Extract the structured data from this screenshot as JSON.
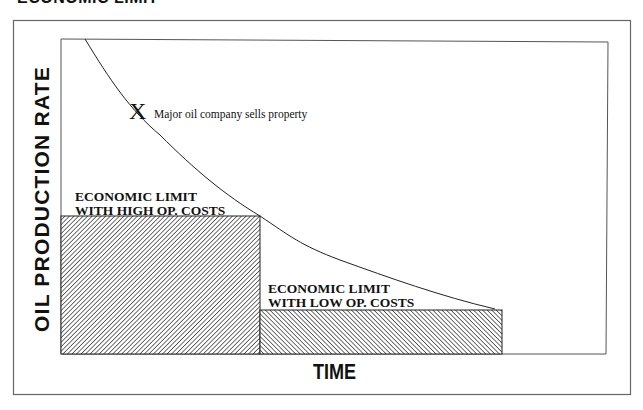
{
  "page": {
    "clipped_title": "ECONOMIC LIMIT"
  },
  "axes": {
    "y_label": "OIL PRODUCTION RATE",
    "x_label": "TIME"
  },
  "regions": [
    {
      "id": "high-cost",
      "label_line1": "ECONOMIC LIMIT",
      "label_line2": "WITH HIGH OP.  COSTS",
      "hatch": "backslash"
    },
    {
      "id": "low-cost",
      "label_line1": "ECONOMIC LIMIT",
      "label_line2": "WITH LOW OP. COSTS",
      "hatch": "forward-slash"
    }
  ],
  "annotation": {
    "marker": "X",
    "text": "Major oil company sells property"
  },
  "colors": {
    "line": "#222222",
    "frame": "#555555",
    "hatch": "#333333",
    "background": "#ffffff"
  }
}
